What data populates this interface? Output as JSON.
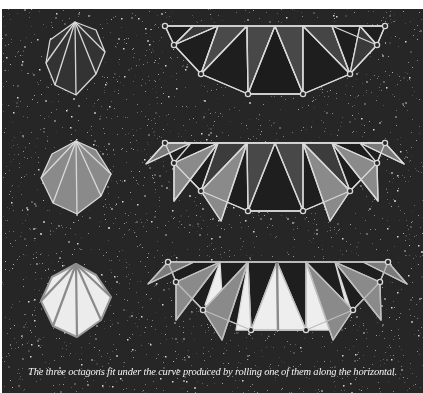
{
  "figure": {
    "caption": "The three octagons fit under the curve produced by rolling one of them along the horizontal.",
    "colors": {
      "background": "#262626",
      "stroke": "#d9d9d9",
      "dark_fill": "#1c1c1c",
      "mid_fill": "#4a4a4a",
      "light_fill": "#8c8c8c",
      "white_fill": "#eeeeee"
    },
    "rows": [
      {
        "id": "row-1",
        "octagon_label": "octagon-dark",
        "chain_label": "rolling-curve-1"
      },
      {
        "id": "row-2",
        "octagon_label": "octagon-gray",
        "chain_label": "rolling-curve-2"
      },
      {
        "id": "row-3",
        "octagon_label": "octagon-light",
        "chain_label": "rolling-curve-3"
      }
    ]
  }
}
